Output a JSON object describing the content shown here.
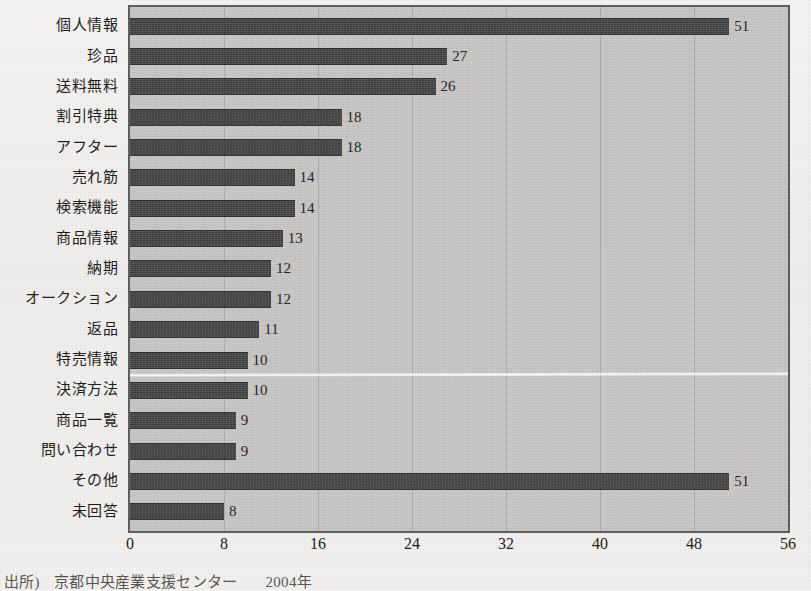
{
  "chart_data": {
    "type": "bar",
    "orientation": "horizontal",
    "title": "",
    "subtitle": "",
    "xlabel": "",
    "ylabel": "",
    "categories": [
      "個人情報",
      "珍品",
      "送料無料",
      "割引特典",
      "アフター",
      "売れ筋",
      "検索機能",
      "商品情報",
      "納期",
      "オークション",
      "返品",
      "特売情報",
      "決済方法",
      "商品一覧",
      "問い合わせ",
      "その他",
      "未回答"
    ],
    "values": [
      51,
      27,
      26,
      18,
      18,
      14,
      14,
      13,
      12,
      12,
      11,
      10,
      10,
      9,
      9,
      51,
      8
    ],
    "xlim": [
      0,
      56
    ],
    "xticks": [
      0,
      8,
      16,
      24,
      32,
      40,
      48,
      56
    ],
    "xtick_labels": [
      "0",
      "8",
      "16",
      "24",
      "32",
      "40",
      "48",
      "56"
    ],
    "grid": true,
    "grid_axis": "x",
    "legend": false,
    "data_labels": true,
    "bar_color": "#3b3b3b",
    "plot_background": "#c9c8c6",
    "axis_color": "#5d5d5d"
  },
  "footer": {
    "source_label": "出所)",
    "source_name": "京都中央産業支援センター",
    "source_year": "2004年"
  }
}
